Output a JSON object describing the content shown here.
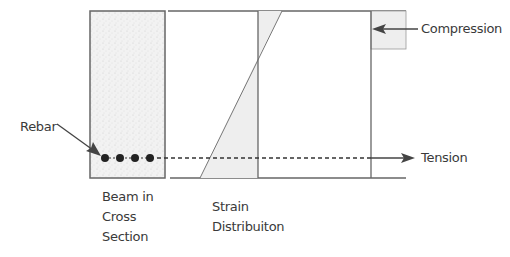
{
  "diagram": {
    "labels": {
      "rebar": "Rebar",
      "compression": "Compression",
      "tension": "Tension",
      "beam_section": [
        "Beam in",
        "Cross",
        "Section"
      ],
      "strain_distribution": [
        "Strain",
        "Distribuiton"
      ]
    },
    "rebar_count": 4,
    "colors": {
      "line": "#555555",
      "fill_light": "#eeeeee",
      "beam_fill": "#f0f0f0",
      "text": "#3a3a3a",
      "dot": "#222222"
    }
  }
}
